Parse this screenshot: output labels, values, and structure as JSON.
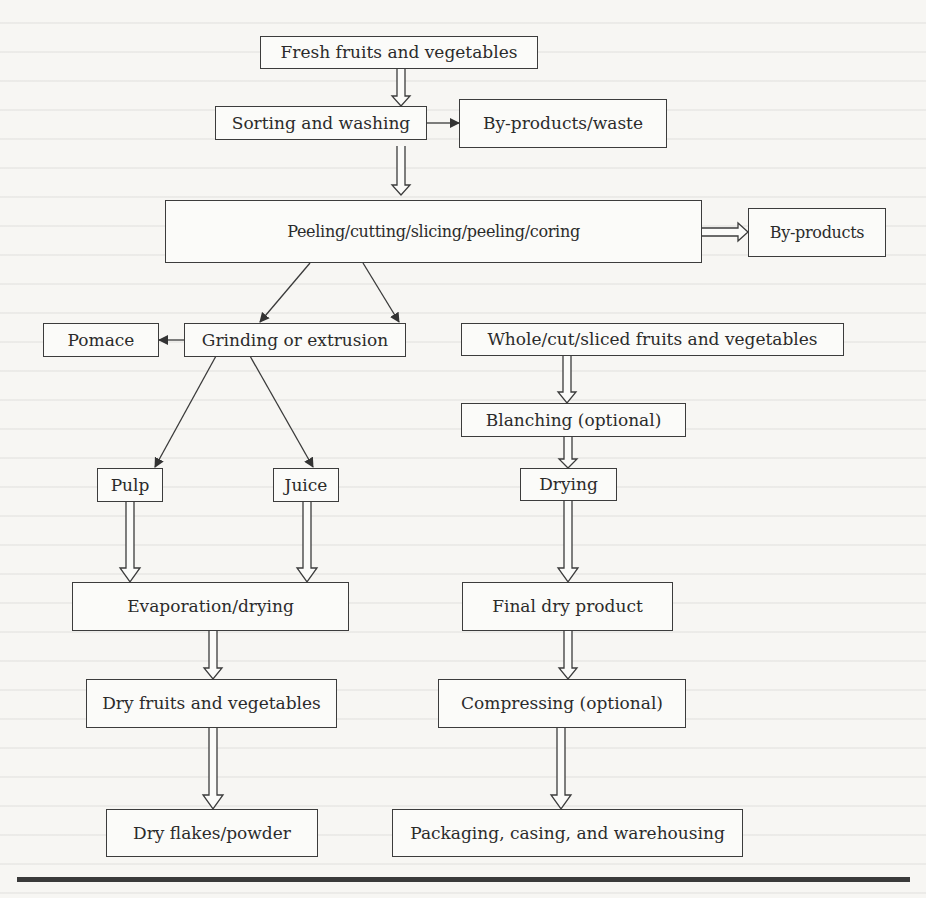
{
  "diagram": {
    "type": "flowchart",
    "nodes": {
      "fresh": "Fresh fruits and vegetables",
      "sorting": "Sorting and washing",
      "byproducts_waste": "By-products/waste",
      "peeling": "Peeling/cutting/slicing/peeling/coring",
      "byproducts": "By-products",
      "pomace": "Pomace",
      "grinding": "Grinding or extrusion",
      "whole_cut": "Whole/cut/sliced fruits and vegetables",
      "blanching": "Blanching (optional)",
      "pulp": "Pulp",
      "juice": "Juice",
      "drying": "Drying",
      "evaporation": "Evaporation/drying",
      "final_dry": "Final dry product",
      "dry_fv": "Dry fruits and vegetables",
      "compressing": "Compressing (optional)",
      "dry_flakes": "Dry flakes/powder",
      "packaging": "Packaging, casing, and warehousing"
    },
    "edges": [
      {
        "from": "fresh",
        "to": "sorting",
        "style": "hollow-double"
      },
      {
        "from": "sorting",
        "to": "byproducts_waste",
        "style": "solid-arrow"
      },
      {
        "from": "sorting",
        "to": "peeling",
        "style": "hollow-double"
      },
      {
        "from": "peeling",
        "to": "byproducts",
        "style": "hollow-double"
      },
      {
        "from": "peeling",
        "to": "grinding",
        "style": "solid-arrow"
      },
      {
        "from": "peeling",
        "to": "whole_cut",
        "style": "solid-arrow"
      },
      {
        "from": "grinding",
        "to": "pomace",
        "style": "solid-arrow"
      },
      {
        "from": "grinding",
        "to": "pulp",
        "style": "solid-arrow"
      },
      {
        "from": "grinding",
        "to": "juice",
        "style": "solid-arrow"
      },
      {
        "from": "pulp",
        "to": "evaporation",
        "style": "hollow-double"
      },
      {
        "from": "juice",
        "to": "evaporation",
        "style": "hollow-double"
      },
      {
        "from": "evaporation",
        "to": "dry_fv",
        "style": "hollow-double"
      },
      {
        "from": "dry_fv",
        "to": "dry_flakes",
        "style": "hollow-double"
      },
      {
        "from": "whole_cut",
        "to": "blanching",
        "style": "hollow-double"
      },
      {
        "from": "blanching",
        "to": "drying",
        "style": "hollow-double"
      },
      {
        "from": "drying",
        "to": "final_dry",
        "style": "hollow-double"
      },
      {
        "from": "final_dry",
        "to": "compressing",
        "style": "hollow-double"
      },
      {
        "from": "compressing",
        "to": "packaging",
        "style": "hollow-double"
      }
    ]
  },
  "colors": {
    "ink": "#3c3c3c",
    "paper": "#f7f6f3"
  }
}
